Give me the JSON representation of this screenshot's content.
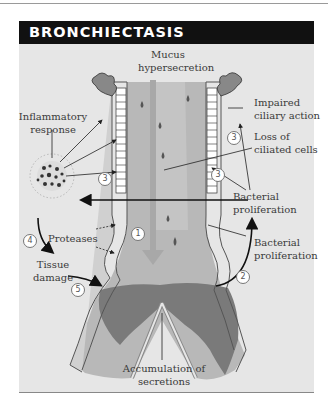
{
  "title": "BRONCHIECTASIS",
  "labels": {
    "mucus_hypersecretion": [
      "Mucus",
      "hypersecretion"
    ],
    "inflammatory_response": [
      "Inflammatory",
      "response"
    ],
    "impaired_ciliary_action": [
      "Impaired",
      "ciliary action"
    ],
    "loss_of_ciliated_cells": [
      "Loss of",
      "ciliated cells"
    ],
    "bacterial_proliferation_upper": [
      "Bacterial",
      "proliferation"
    ],
    "bacterial_proliferation_lower": [
      "Bacterial",
      "proliferation"
    ],
    "proteases": "Proteases",
    "tissue_damage": [
      "Tissue",
      "damage"
    ],
    "accumulation_of_secretions": [
      "Accumulation of",
      "secretions"
    ]
  },
  "step_numbers": {
    "n1": "1",
    "n2": "2",
    "n3_right_top": "3",
    "n3_right": "3",
    "n3_left": "3",
    "n4": "4",
    "n5": "5"
  },
  "colors": {
    "header_bg": "#111111",
    "panel_bg": "#e6e6e6",
    "airway_lumen": "#b4b4b4",
    "secretions": "#7a7a7a",
    "mucus_arrow": "#a8a8a8",
    "wall": "#c8c8c8"
  }
}
